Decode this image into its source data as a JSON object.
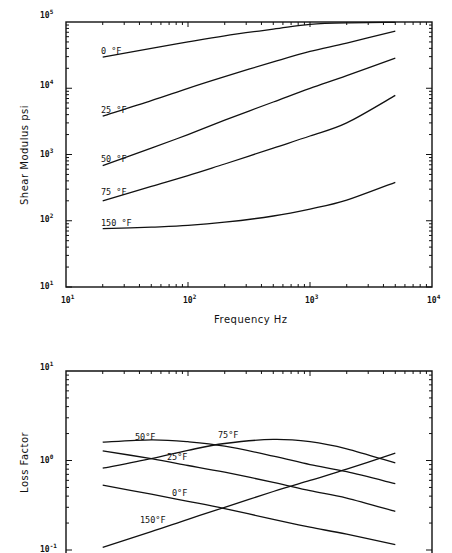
{
  "chart_data": [
    {
      "type": "line",
      "title": "",
      "xlabel": "Frequency Hz",
      "ylabel": "Shear Modulus psi",
      "xscale": "log",
      "yscale": "log",
      "xlim": [
        10,
        10000
      ],
      "ylim": [
        10,
        100000
      ],
      "x_tick_labels": [
        "10^1",
        "10^2",
        "10^3",
        "10^4"
      ],
      "y_tick_labels": [
        "10^1",
        "10^2",
        "10^3",
        "10^4",
        "10^5"
      ],
      "grid": false,
      "legend": "inline curve labels",
      "x": [
        20,
        50,
        100,
        200,
        500,
        1000,
        2000,
        5000
      ],
      "series": [
        {
          "name": "0 °F",
          "values": [
            29500,
            40000,
            50000,
            62000,
            78000,
            92000,
            97000,
            99000
          ]
        },
        {
          "name": "25 °F",
          "values": [
            3800,
            6500,
            10000,
            15000,
            25000,
            36000,
            48000,
            73000
          ]
        },
        {
          "name": "50 °F",
          "values": [
            680,
            1250,
            2000,
            3300,
            6200,
            10000,
            15500,
            28500
          ]
        },
        {
          "name": "75 °F",
          "values": [
            200,
            330,
            480,
            720,
            1250,
            1900,
            3000,
            7800
          ]
        },
        {
          "name": "150 °F",
          "values": [
            76,
            80,
            85,
            95,
            118,
            150,
            205,
            380
          ]
        }
      ]
    },
    {
      "type": "line",
      "title": "",
      "xlabel": "",
      "ylabel": "Loss Factor",
      "xscale": "log",
      "yscale": "log",
      "xlim": [
        10,
        10000
      ],
      "ylim": [
        0.1,
        10
      ],
      "y_tick_labels": [
        "10^-1",
        "10^0",
        "10^1"
      ],
      "grid": false,
      "legend": "inline curve labels",
      "x": [
        20,
        50,
        100,
        200,
        500,
        1000,
        2000,
        5000
      ],
      "series": [
        {
          "name": "0°F",
          "values": [
            0.53,
            0.42,
            0.35,
            0.29,
            0.22,
            0.18,
            0.15,
            0.115
          ]
        },
        {
          "name": "25°F",
          "values": [
            1.28,
            1.05,
            0.88,
            0.74,
            0.57,
            0.46,
            0.38,
            0.27
          ]
        },
        {
          "name": "50°F",
          "values": [
            1.6,
            1.7,
            1.62,
            1.45,
            1.12,
            0.9,
            0.75,
            0.55
          ]
        },
        {
          "name": "75°F",
          "values": [
            0.82,
            1.05,
            1.3,
            1.55,
            1.72,
            1.62,
            1.35,
            0.94
          ]
        },
        {
          "name": "150°F",
          "values": [
            0.107,
            0.16,
            0.22,
            0.3,
            0.45,
            0.6,
            0.8,
            1.21
          ]
        }
      ]
    }
  ],
  "top_chart": {
    "ylabel": "Shear Modulus psi",
    "xlabel": "Frequency Hz",
    "x_ticks": [
      {
        "base": "10",
        "exp": "1"
      },
      {
        "base": "10",
        "exp": "2"
      },
      {
        "base": "10",
        "exp": "3"
      },
      {
        "base": "10",
        "exp": "4"
      }
    ],
    "y_ticks": [
      {
        "base": "10",
        "exp": "5"
      },
      {
        "base": "10",
        "exp": "4"
      },
      {
        "base": "10",
        "exp": "3"
      },
      {
        "base": "10",
        "exp": "2"
      },
      {
        "base": "10",
        "exp": "1"
      }
    ],
    "labels": [
      "0 °F",
      "25 °F",
      "50 °F",
      "75 °F",
      "150 °F"
    ]
  },
  "bottom_chart": {
    "ylabel": "Loss Factor",
    "y_ticks": [
      {
        "base": "10",
        "exp": "1"
      },
      {
        "base": "10",
        "exp": "0"
      },
      {
        "base": "10",
        "exp": "-1"
      }
    ],
    "labels": [
      "50°F",
      "75°F",
      "25°F",
      "0°F",
      "150°F"
    ]
  }
}
